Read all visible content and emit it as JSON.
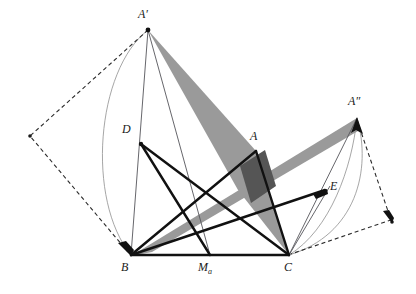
{
  "figure": {
    "canvas": {
      "width": 416,
      "height": 294
    },
    "colors": {
      "background": "#ffffff",
      "stroke_thick": "#111111",
      "stroke_thin": "#4a4a4a",
      "stroke_dashed": "#2b2b2b",
      "arc": "#8a8a8a",
      "fill_light_gray": "#9a9a9a",
      "fill_dark_gray": "#555555",
      "label": "#1a1a1a"
    },
    "points": {
      "A": {
        "label": "A",
        "x": 255,
        "y": 152,
        "label_x": 252,
        "label_y": 132
      },
      "Ap": {
        "label": "A′",
        "x": 148,
        "y": 30,
        "label_x": 142,
        "label_y": 10
      },
      "App": {
        "label": "A″",
        "x": 357,
        "y": 118,
        "label_x": 350,
        "label_y": 97
      },
      "B": {
        "label": "B",
        "x": 131,
        "y": 255,
        "label_x": 123,
        "label_y": 262
      },
      "C": {
        "label": "C",
        "x": 289,
        "y": 255,
        "label_x": 285,
        "label_y": 262
      },
      "D": {
        "label": "D",
        "x": 141,
        "y": 144,
        "label_x": 124,
        "label_y": 126
      },
      "E": {
        "label": "E",
        "x": 326,
        "y": 191,
        "label_x": 331,
        "label_y": 183
      },
      "Ma": {
        "label": "M",
        "sub": "a",
        "x": 210,
        "y": 255,
        "label_x": 199,
        "label_y": 262
      },
      "Pleft": {
        "label": "",
        "x": 30,
        "y": 136
      },
      "Pright": {
        "label": "",
        "x": 392,
        "y": 222
      }
    },
    "polygons": [
      {
        "name": "gray-wedge-Aprime-to-C",
        "fill": "#9a9a9a",
        "vertices": "148,30 255,152 289,255 236,186"
      },
      {
        "name": "gray-band-B-to-Aprimeprime",
        "fill": "#9a9a9a",
        "vertices": "131,255 357,118 357,130 158,247"
      },
      {
        "name": "dark-overlap-quad",
        "fill": "#555555",
        "vertices": "238,162 262,148 274,188 250,202"
      }
    ],
    "thick_segments": [
      {
        "name": "segment-B-C",
        "from": "B",
        "to": "C"
      },
      {
        "name": "segment-D-C",
        "from": "D",
        "to": "C"
      },
      {
        "name": "segment-B-A",
        "from": "B",
        "to": "A"
      },
      {
        "name": "segment-A-C",
        "from": "A",
        "to": "C"
      },
      {
        "name": "segment-D-Ma",
        "from": "D",
        "to": "Ma"
      },
      {
        "name": "segment-B-E",
        "from": "B",
        "to": "E"
      }
    ],
    "thin_segments": [
      {
        "name": "segment-Aprime-B",
        "from": "Ap",
        "to": "B"
      },
      {
        "name": "segment-Aprime-Ma",
        "from": "Ap",
        "to": "Ma"
      },
      {
        "name": "segment-C-Aprimeprime",
        "from": "C",
        "to": "App"
      },
      {
        "name": "segment-C-E-extended",
        "from": "C",
        "to": "App"
      },
      {
        "name": "segment-Ma-C",
        "from": "Ma",
        "to": "C"
      }
    ],
    "dashed_paths": [
      {
        "name": "dashed-path-left",
        "points": "148,30 30,136 131,255",
        "arrow_at": "131,255"
      },
      {
        "name": "dashed-path-right",
        "points": "357,118 392,222 289,255",
        "arrow_at": "392,222"
      }
    ],
    "arcs": [
      {
        "name": "arc-Aprime-to-B",
        "from": "148,30",
        "to": "131,255",
        "bulge": "left"
      },
      {
        "name": "arc-Aprimeprime-to-C",
        "from": "357,118",
        "to": "289,255",
        "bulge": "right"
      },
      {
        "name": "arc-Aprimeprime-to-C-inner",
        "from": "357,118",
        "to": "289,255",
        "bulge": "right-inner"
      }
    ],
    "arrowheads": [
      {
        "name": "arrowhead-at-B",
        "x": 131,
        "y": 255
      },
      {
        "name": "arrowhead-at-Aprimeprime",
        "x": 357,
        "y": 118
      },
      {
        "name": "arrowhead-at-E",
        "x": 326,
        "y": 191
      },
      {
        "name": "arrowhead-at-Pright",
        "x": 392,
        "y": 222
      }
    ]
  }
}
